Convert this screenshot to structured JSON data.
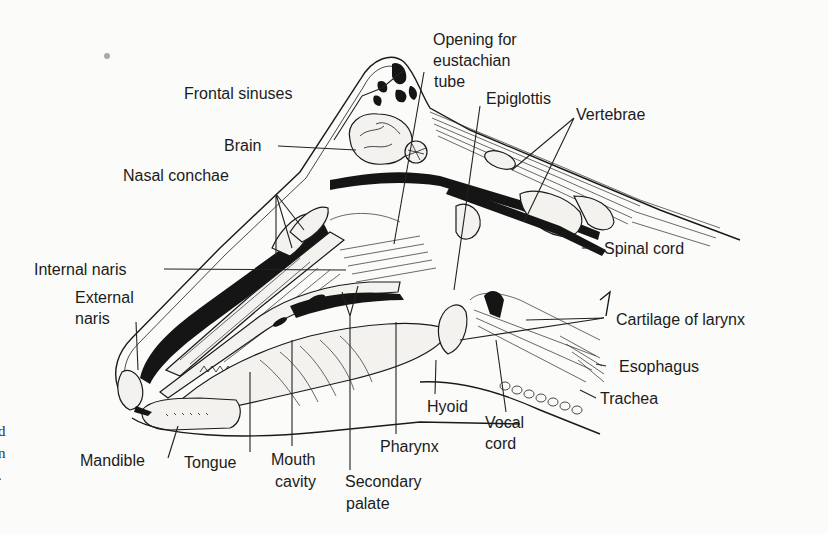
{
  "figure": {
    "labels": {
      "frontal_sinuses": "Frontal sinuses",
      "brain": "Brain",
      "nasal_conchae": "Nasal conchae",
      "internal_naris": "Internal naris",
      "external_naris_1": "External",
      "external_naris_2": "naris",
      "opening_eustachian_1": "Opening for",
      "opening_eustachian_2": "eustachian",
      "opening_eustachian_3": "tube",
      "epiglottis": "Epiglottis",
      "vertebrae": "Vertebrae",
      "spinal_cord": "Spinal cord",
      "cartilage_of_larynx": "Cartilage of larynx",
      "esophagus": "Esophagus",
      "trachea": "Trachea",
      "hyoid": "Hyoid",
      "vocal_cord_1": "Vocal",
      "vocal_cord_2": "cord",
      "pharynx": "Pharynx",
      "secondary_palate_1": "Secondary",
      "secondary_palate_2": "palate",
      "mouth_cavity_1": "Mouth",
      "mouth_cavity_2": "cavity",
      "tongue": "Tongue",
      "mandible": "Mandible"
    },
    "edge_text": [
      "d",
      "n",
      "."
    ]
  }
}
